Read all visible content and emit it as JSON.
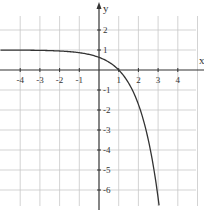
{
  "chart_data": {
    "type": "line",
    "title": "",
    "xlabel": "x",
    "ylabel": "y",
    "xlim": [
      -5,
      5.3
    ],
    "ylim": [
      -7,
      3.5
    ],
    "grid": true,
    "x_ticks": [
      -4,
      -3,
      -2,
      -1,
      1,
      2,
      3,
      4
    ],
    "y_ticks": [
      2,
      1,
      -1,
      -2,
      -3,
      -4,
      -5,
      -6
    ],
    "x_tick_labels": [
      "-4",
      "-3",
      "-2",
      "-1",
      "1",
      "2",
      "3",
      "4"
    ],
    "y_tick_labels": [
      "2",
      "1",
      "-1",
      "-2",
      "-3",
      "-4",
      "-5",
      "-6"
    ],
    "series": [
      {
        "name": "y = 1 - e^(x-1)",
        "color": "#333333",
        "x": [
          -5,
          -4,
          -3,
          -2,
          -1,
          0,
          0.5,
          1,
          1.5,
          2,
          2.5,
          3,
          3.05
        ],
        "y": [
          1.0,
          0.99,
          0.98,
          0.95,
          0.86,
          0.63,
          0.39,
          0.0,
          -0.65,
          -1.72,
          -3.48,
          -6.39,
          -6.77
        ]
      }
    ],
    "annotations": {
      "horizontal_asymptote": 1,
      "x_intercept": 1,
      "y_intercept": 0.63
    }
  },
  "axes": {
    "x_label": "x",
    "y_label": "y"
  },
  "colors": {
    "grid": "#c8c8c8",
    "axis": "#333333",
    "curve": "#333333",
    "background": "#ffffff"
  }
}
